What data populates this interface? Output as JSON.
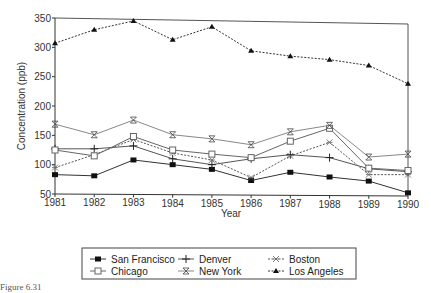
{
  "chart_data": {
    "type": "line",
    "title": "",
    "xlabel": "Year",
    "ylabel": "Concentration (ppb)",
    "x": [
      1981,
      1982,
      1983,
      1984,
      1985,
      1986,
      1987,
      1988,
      1989,
      1990
    ],
    "xticks": [
      "1981",
      "1982",
      "1983",
      "1984",
      "1985",
      "1986",
      "1987",
      "1988",
      "1989",
      "1990"
    ],
    "yticks": [
      "50",
      "100",
      "150",
      "200",
      "250",
      "300",
      "350"
    ],
    "ytick_values": [
      50,
      100,
      150,
      200,
      250,
      300,
      350
    ],
    "ylim": [
      50,
      350
    ],
    "xlim": [
      1981,
      1990
    ],
    "grid": false,
    "legend_placement": "bottom",
    "series": [
      {
        "name": "San Francisco",
        "marker": "filled-square",
        "dash": "solid",
        "color": "#333333",
        "values": [
          83,
          81,
          108,
          100,
          92,
          73,
          87,
          79,
          72,
          52
        ]
      },
      {
        "name": "Denver",
        "marker": "plus",
        "dash": "solid",
        "color": "#555555",
        "values": [
          127,
          127,
          132,
          110,
          100,
          110,
          117,
          112,
          93,
          88
        ]
      },
      {
        "name": "Boston",
        "marker": "asterisk",
        "dash": "dotted",
        "color": "#555555",
        "values": [
          95,
          117,
          143,
          120,
          108,
          78,
          115,
          138,
          83,
          83
        ]
      },
      {
        "name": "Chicago",
        "marker": "open-square",
        "dash": "solid",
        "color": "#666666",
        "values": [
          125,
          115,
          148,
          125,
          118,
          112,
          140,
          162,
          94,
          90
        ]
      },
      {
        "name": "New York",
        "marker": "x",
        "dash": "solid",
        "color": "#888888",
        "values": [
          169,
          151,
          176,
          151,
          144,
          134,
          156,
          167,
          113,
          118
        ]
      },
      {
        "name": "Los Angeles",
        "marker": "filled-triangle",
        "dash": "dotted",
        "color": "#333333",
        "values": [
          307,
          330,
          345,
          313,
          335,
          294,
          285,
          279,
          269,
          238
        ]
      }
    ]
  },
  "caption": "Figure 6.31"
}
